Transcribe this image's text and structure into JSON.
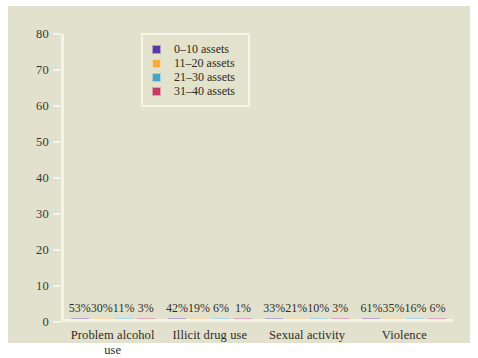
{
  "chart_data": {
    "type": "bar",
    "title": "",
    "subtitle": "",
    "xlabel": "",
    "ylabel": "",
    "ylim": [
      0,
      80
    ],
    "ytick_labels": [
      "80",
      "70",
      "60",
      "50",
      "40",
      "30",
      "20",
      "10",
      "0"
    ],
    "yticks": [
      80,
      70,
      60,
      50,
      40,
      30,
      20,
      10,
      0
    ],
    "grid": false,
    "legend_position": "top-center",
    "categories": [
      "Problem alcohol use",
      "Illicit drug use",
      "Sexual activity",
      "Violence"
    ],
    "series": [
      {
        "name": "0–10 assets",
        "color": "#5b3a9e",
        "values": [
          53,
          42,
          33,
          61
        ],
        "labels": [
          "53%",
          "42%",
          "33%",
          "61%"
        ]
      },
      {
        "name": "11–20 assets",
        "color": "#f5a93f",
        "values": [
          30,
          19,
          21,
          35
        ],
        "labels": [
          "30%",
          "19%",
          "21%",
          "35%"
        ]
      },
      {
        "name": "21–30 assets",
        "color": "#4ba3c3",
        "values": [
          11,
          6,
          10,
          16
        ],
        "labels": [
          "11%",
          "6%",
          "10%",
          "16%"
        ]
      },
      {
        "name": "31–40 assets",
        "color": "#c13b63",
        "values": [
          3,
          1,
          3,
          6
        ],
        "labels": [
          "3%",
          "1%",
          "3%",
          "6%"
        ]
      }
    ]
  },
  "colors": {
    "figure_background": "#e2e1cd",
    "axis_line": "#f4f3e6",
    "text": "#2e2c24",
    "legend_border": "#f6f5ea"
  }
}
